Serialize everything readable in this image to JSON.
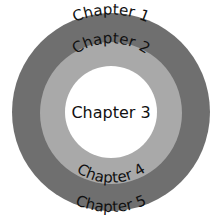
{
  "diagram": {
    "type": "concentric-rings",
    "colors": {
      "outer": "#6f6f6f",
      "middle": "#a9a9a9",
      "inner": "#ffffff",
      "text": "#111111"
    },
    "rings": [
      {
        "id": "outer",
        "top_label": "Chapter 1",
        "bottom_label": "Chapter 5"
      },
      {
        "id": "middle",
        "top_label": "Chapter 2",
        "bottom_label": "Chapter 4"
      },
      {
        "id": "inner",
        "center_label": "Chapter 3"
      }
    ]
  }
}
